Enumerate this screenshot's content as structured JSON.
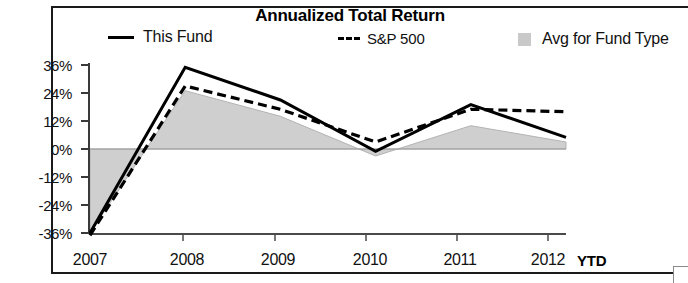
{
  "chart_data": {
    "type": "line",
    "title": "Annualized Total Return",
    "xlabel": "",
    "ylabel": "",
    "categories": [
      "2007",
      "2008",
      "2009",
      "2010",
      "2011",
      "2012"
    ],
    "x_axis_suffix": "YTD",
    "ytick_labels": [
      "36%",
      "24%",
      "12%",
      "0%",
      "-12%",
      "-24%",
      "-36%"
    ],
    "ytick_values": [
      36,
      24,
      12,
      0,
      -12,
      -24,
      -36
    ],
    "ylim": [
      -36,
      36
    ],
    "grid": false,
    "legend_position": "top",
    "series": [
      {
        "name": "This Fund",
        "style": "solid-line",
        "color": "#000000",
        "values": [
          -36,
          35,
          21,
          -1,
          19,
          5
        ]
      },
      {
        "name": "S&P 500",
        "style": "dashed-line",
        "color": "#000000",
        "values": [
          -37,
          27,
          17,
          3,
          17,
          16
        ]
      },
      {
        "name": "Avg for Fund Type",
        "style": "filled-area",
        "color": "#cccccc",
        "values": [
          -36,
          25,
          14,
          -3,
          10,
          3
        ]
      }
    ]
  },
  "legend": {
    "fund": "This Fund",
    "sp500": "S&P 500",
    "avg": "Avg for Fund Type"
  },
  "axis": {
    "y_ticks": [
      "36%",
      "24%",
      "12%",
      "0%",
      "-12%",
      "-24%",
      "-36%"
    ],
    "x_ticks": [
      "2007",
      "2008",
      "2009",
      "2010",
      "2011",
      "2012"
    ],
    "ytd": "YTD"
  }
}
